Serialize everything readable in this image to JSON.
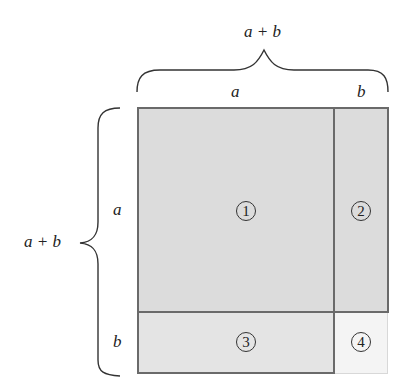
{
  "diagram": {
    "top_brace_label": "a + b",
    "left_brace_label": "a + b",
    "top_labels": [
      "a",
      "b"
    ],
    "left_labels": [
      "a",
      "b"
    ],
    "regions": [
      {
        "id": "1",
        "label": "1",
        "glyph": "①",
        "fill": "#dcdcdc"
      },
      {
        "id": "2",
        "label": "2",
        "glyph": "②",
        "fill": "#dcdcdc"
      },
      {
        "id": "3",
        "label": "3",
        "glyph": "③",
        "fill": "#e4e4e4"
      },
      {
        "id": "4",
        "label": "4",
        "glyph": "④",
        "fill": "#f4f4f4"
      }
    ],
    "border_color": "#6a6a6a"
  }
}
